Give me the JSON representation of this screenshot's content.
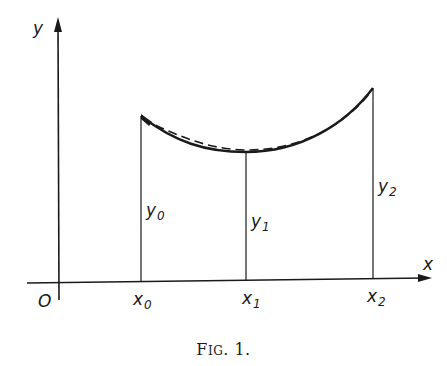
{
  "figure": {
    "caption": {
      "prefix": "F",
      "smallcaps": "IG",
      "suffix": ". 1."
    },
    "axes": {
      "x_label": "x",
      "y_label": "y",
      "origin_label": "O"
    },
    "x_ticks": [
      {
        "base": "x",
        "sub": "0"
      },
      {
        "base": "x",
        "sub": "1"
      },
      {
        "base": "x",
        "sub": "2"
      }
    ],
    "ordinates": [
      {
        "base": "y",
        "sub": "0"
      },
      {
        "base": "y",
        "sub": "1"
      },
      {
        "base": "y",
        "sub": "2"
      }
    ],
    "curves": [
      {
        "name": "solid-curve",
        "style": "solid",
        "description": "true function through (x0,y0),(x1,y1),(x2,y2)"
      },
      {
        "name": "dashed-curve",
        "style": "dashed",
        "description": "approximating parabola"
      }
    ],
    "colors": {
      "ink": "#1a1a1a",
      "background": "#ffffff"
    }
  }
}
